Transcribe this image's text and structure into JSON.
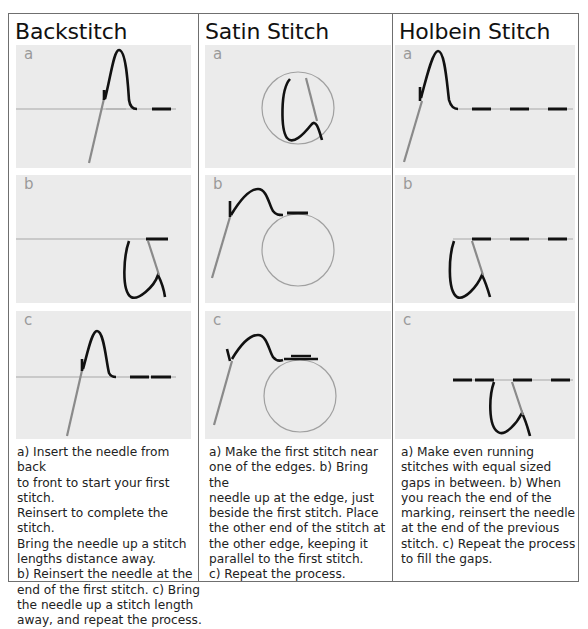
{
  "columns": [
    {
      "title": "Backstitch",
      "panels": [
        {
          "label": "a"
        },
        {
          "label": "b"
        },
        {
          "label": "c"
        }
      ],
      "description": [
        "a) Insert the needle from back",
        "to front to start your first stitch.",
        "Reinsert to complete the stitch.",
        "Bring the needle up a stitch",
        "lengths distance away.",
        "b) Reinsert the needle at the",
        "end of the first stitch. c) Bring",
        "the needle up a stitch length",
        "away, and repeat the process."
      ]
    },
    {
      "title": "Satin Stitch",
      "panels": [
        {
          "label": "a"
        },
        {
          "label": "b"
        },
        {
          "label": "c"
        }
      ],
      "description": [
        "a) Make the first stitch near",
        "one of the edges. b) Bring the",
        "needle up at the edge, just",
        "beside the first stitch. Place",
        "the other end of the stitch at",
        "the other edge, keeping it",
        "parallel to the first stitch.",
        "c) Repeat the process."
      ]
    },
    {
      "title": "Holbein Stitch",
      "panels": [
        {
          "label": "a"
        },
        {
          "label": "b"
        },
        {
          "label": "c"
        }
      ],
      "description": [
        "a) Make even running",
        "stitches with equal sized",
        "gaps in between. b) When",
        "you reach the end of the",
        "marking, reinsert the needle",
        "at the end of the previous",
        "stitch. c) Repeat the process",
        "to fill the gaps."
      ]
    }
  ],
  "colors": {
    "thread": "#111111",
    "needle": "#8a8a8a",
    "guide_line": "#a8a8a8",
    "panel_bg": "#ebebeb",
    "border": "#6f6f6f"
  }
}
